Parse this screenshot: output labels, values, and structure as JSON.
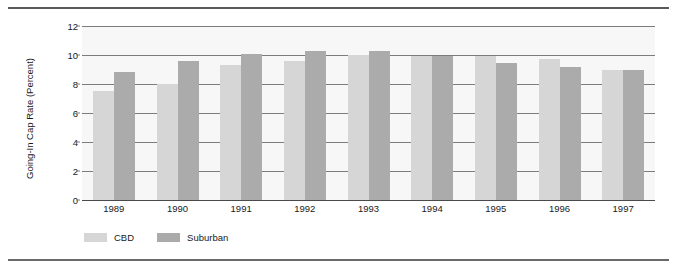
{
  "chart_data": {
    "type": "bar",
    "title": "",
    "xlabel": "",
    "ylabel": "Going-In Cap Rate (Percent)",
    "categories": [
      "1989",
      "1990",
      "1991",
      "1992",
      "1993",
      "1994",
      "1995",
      "1996",
      "1997"
    ],
    "series": [
      {
        "name": "CBD",
        "color": "#d6d6d6",
        "values": [
          7.5,
          8.0,
          9.3,
          9.6,
          10.0,
          9.9,
          9.9,
          9.7,
          9.0
        ]
      },
      {
        "name": "Suburban",
        "color": "#ababab",
        "values": [
          8.8,
          9.6,
          10.05,
          10.3,
          10.25,
          9.9,
          9.45,
          9.15,
          8.95
        ]
      }
    ],
    "ylim": [
      0,
      12
    ],
    "yticks": [
      0,
      2,
      4,
      6,
      8,
      10,
      12
    ],
    "ytick_labels": [
      "0",
      "2",
      "4",
      "6",
      "8",
      "10",
      "12"
    ],
    "grid": true,
    "legend_position": "bottom-left"
  },
  "legend": {
    "items": [
      {
        "label": "CBD",
        "color": "#d6d6d6"
      },
      {
        "label": "Suburban",
        "color": "#ababab"
      }
    ]
  },
  "colors": {
    "plot_background": "#f7f7f7",
    "gridline": "#7c7c7c",
    "rule": "#5a5a5a",
    "text": "#1a1a1a"
  }
}
